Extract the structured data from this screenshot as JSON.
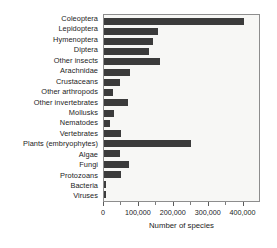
{
  "chart_data": {
    "type": "bar",
    "orientation": "horizontal",
    "title": "",
    "subtitle": "",
    "xlabel": "Number of species",
    "ylabel": "",
    "xlim": [
      0,
      450000
    ],
    "xticks": [
      0,
      100000,
      200000,
      300000,
      400000
    ],
    "xtick_labels": [
      "0",
      "100,000",
      "200,000",
      "300,000",
      "400,000"
    ],
    "minor_xticks": [
      50000,
      150000,
      250000,
      350000
    ],
    "grid": false,
    "legend": null,
    "bar_color": "#3b3b3b",
    "plot_background": "#f7f7f5",
    "plot_border_color": "#8d8d8d",
    "categories": [
      "Coleoptera",
      "Lepidoptera",
      "Hymenoptera",
      "Diptera",
      "Other insects",
      "Arachnidae",
      "Crustaceans",
      "Other arthropods",
      "Other invertebrates",
      "Mollusks",
      "Nematodes",
      "Vertebrates",
      "Plants (embryophytes)",
      "Algae",
      "Fungi",
      "Protozoans",
      "Bacteria",
      "Viruses"
    ],
    "values": [
      400000,
      155000,
      140000,
      130000,
      160000,
      75000,
      45000,
      25000,
      70000,
      30000,
      18000,
      48000,
      250000,
      45000,
      72000,
      50000,
      5000,
      5000
    ]
  }
}
